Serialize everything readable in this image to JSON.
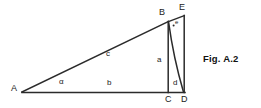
{
  "figure": {
    "caption": "Fig. A.2",
    "type": "geometry-diagram",
    "stroke_color": "#2b2b2b",
    "text_color": "#1a1a1a",
    "background_color": "#ffffff",
    "vertices": [
      {
        "name": "A",
        "label": "A",
        "x": 22,
        "y": 92
      },
      {
        "name": "B",
        "label": "B",
        "x": 168,
        "y": 22
      },
      {
        "name": "C",
        "label": "C",
        "x": 168,
        "y": 92
      },
      {
        "name": "D",
        "label": "D",
        "x": 184,
        "y": 92
      },
      {
        "name": "E",
        "label": "E",
        "x": 184,
        "y": 16
      }
    ],
    "vertex_labels": {
      "A": "A",
      "B": "B",
      "C": "C",
      "D": "D",
      "E": "E"
    },
    "side_labels": {
      "hypotenuse": "c",
      "base": "b",
      "height": "a",
      "segment_d": "d"
    },
    "angle_labels": {
      "at_A": "α",
      "at_B": "e"
    },
    "segments": [
      {
        "name": "A-B",
        "from": "A",
        "to": "B",
        "label": "c"
      },
      {
        "name": "A-C",
        "from": "A",
        "to": "C",
        "label": "b"
      },
      {
        "name": "B-C",
        "from": "B",
        "to": "C",
        "label": "a"
      },
      {
        "name": "B-D",
        "from": "B",
        "to": "D",
        "label": ""
      },
      {
        "name": "E-D",
        "from": "E",
        "to": "D",
        "label": ""
      },
      {
        "name": "C-D",
        "from": "C",
        "to": "D",
        "label": "d"
      }
    ]
  }
}
